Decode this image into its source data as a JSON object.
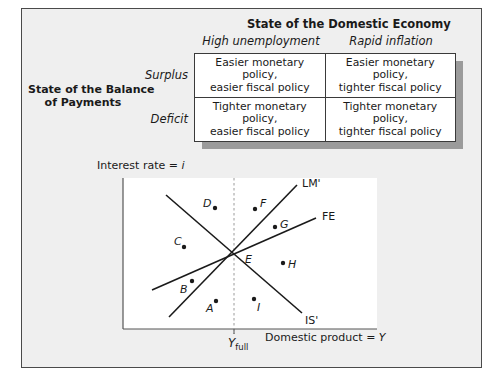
{
  "table": {
    "title": "State of the Domestic Economy",
    "columns": [
      "High unemployment",
      "Rapid inflation"
    ],
    "row_group_label_line1": "State of the Balance",
    "row_group_label_line2": "of Payments",
    "rows": [
      {
        "label": "Surplus",
        "cells": [
          {
            "line1": "Easier monetary policy,",
            "line2": "easier fiscal policy"
          },
          {
            "line1": "Easier monetary policy,",
            "line2": "tighter fiscal policy"
          }
        ]
      },
      {
        "label": "Deficit",
        "cells": [
          {
            "line1": "Tighter monetary policy,",
            "line2": "easier fiscal policy"
          },
          {
            "line1": "Tighter monetary policy,",
            "line2": "tighter fiscal policy"
          }
        ]
      }
    ]
  },
  "diagram": {
    "y_axis_label": "Interest rate = ",
    "y_axis_var": "i",
    "x_axis_label": "Domestic product = ",
    "x_axis_var": "Y",
    "x_tick_main": "Y",
    "x_tick_sub": "full",
    "curves": [
      {
        "name": "LM'",
        "label": "LM'"
      },
      {
        "name": "FE",
        "label": "FE"
      },
      {
        "name": "IS'",
        "label": "IS'"
      }
    ],
    "intersection_label": "E",
    "points": [
      {
        "label": "A"
      },
      {
        "label": "B"
      },
      {
        "label": "C"
      },
      {
        "label": "D"
      },
      {
        "label": "F"
      },
      {
        "label": "G"
      },
      {
        "label": "H"
      },
      {
        "label": "I"
      }
    ]
  },
  "colors": {
    "frame_bg": "#efefef",
    "frame_border": "#4a4a4a",
    "table_shadow": "#9b9b9b",
    "line": "#1a1a1a",
    "dashed_guide": "#9a9a9a"
  }
}
